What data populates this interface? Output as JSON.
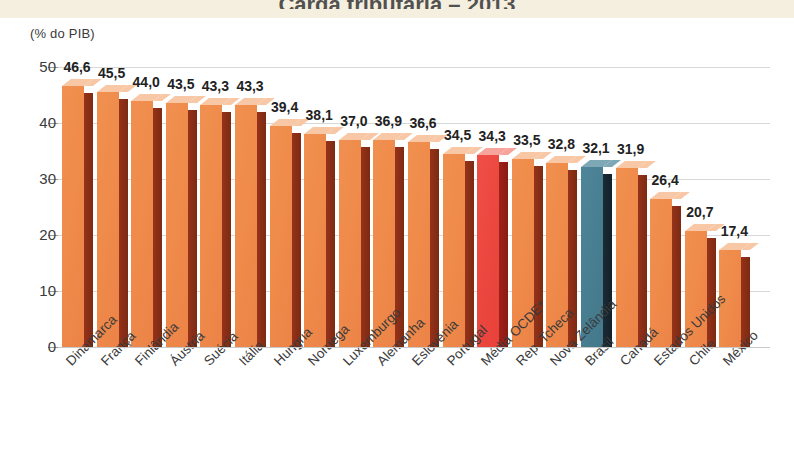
{
  "page": {
    "title_sliver": "Carga tributária – 2013",
    "unit_caption": "(% do PIB)"
  },
  "chart_data": {
    "type": "bar",
    "title": "Carga tributária – 2013",
    "subtitle": "",
    "xlabel": "",
    "ylabel": "(% do PIB)",
    "ylim": [
      0,
      50
    ],
    "yticks": [
      0,
      10,
      20,
      30,
      40,
      50
    ],
    "ytick_labels": [
      "0",
      "10",
      "20",
      "30",
      "40",
      "50"
    ],
    "grid": true,
    "legend": "none",
    "value_format": "comma-decimal",
    "categories": [
      "Dinamarca",
      "França",
      "Finlândia",
      "Áustria",
      "Suécia",
      "Itália",
      "Hungria",
      "Noruega",
      "Luxemburgo",
      "Alemanha",
      "Eslovênia",
      "Portugal",
      "Média OCDE*",
      "Rep. Tcheca",
      "Nova Zelândia",
      "Brasil",
      "Canadá",
      "Estados Unidos",
      "Chile",
      "México"
    ],
    "values": [
      46.6,
      45.5,
      44.0,
      43.5,
      43.3,
      43.3,
      39.4,
      38.1,
      37.0,
      36.9,
      36.6,
      34.5,
      34.3,
      33.5,
      32.8,
      32.1,
      31.9,
      26.4,
      20.7,
      17.4
    ],
    "value_labels": [
      "46,6",
      "45,5",
      "44,0",
      "43,5",
      "43,3",
      "43,3",
      "39,4",
      "38,1",
      "37,0",
      "36,9",
      "36,6",
      "34,5",
      "34,3",
      "33,5",
      "32,8",
      "32,1",
      "31,9",
      "26,4",
      "20,7",
      "17,4"
    ],
    "bar_styles": [
      "orange",
      "orange",
      "orange",
      "orange",
      "orange",
      "orange",
      "orange",
      "orange",
      "orange",
      "orange",
      "orange",
      "orange",
      "red",
      "orange",
      "orange",
      "teal",
      "orange",
      "orange",
      "orange",
      "orange"
    ],
    "colors": {
      "orange_front": "#ef8b4b",
      "orange_side": "#8f2f16",
      "orange_top": "#f8c8a6",
      "red_front": "#e8413a",
      "red_side": "#8a1c13",
      "red_top": "#f7a49c",
      "teal_front": "#497f92",
      "teal_side": "#11202a",
      "teal_top": "#7fa8b6",
      "gridline": "#d8d8d8",
      "text": "#3a3a3a",
      "top_band": "#f4efdf"
    }
  }
}
